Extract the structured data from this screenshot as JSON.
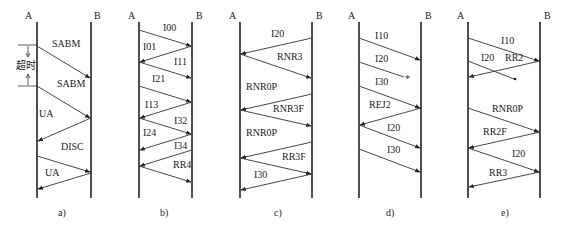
{
  "diagram": {
    "type": "sequence",
    "panels": [
      {
        "id": "a",
        "caption": "a)",
        "station_a": "A",
        "station_b": "B",
        "timeout_label": "超时",
        "messages": [
          {
            "label": "SABM",
            "dir": "A->B"
          },
          {
            "label": "SABM",
            "dir": "A->B"
          },
          {
            "label": "UA",
            "dir": "B->A"
          },
          {
            "label": "DISC",
            "dir": "A->B"
          },
          {
            "label": "UA",
            "dir": "B->A"
          }
        ]
      },
      {
        "id": "b",
        "caption": "b)",
        "station_a": "A",
        "station_b": "B",
        "messages": [
          {
            "label": "I00",
            "dir": "A->B"
          },
          {
            "label": "I01",
            "dir": "B->A"
          },
          {
            "label": "I11",
            "dir": "A->B"
          },
          {
            "label": "I21",
            "dir": "A->B"
          },
          {
            "label": "I13",
            "dir": "B->A"
          },
          {
            "label": "I32",
            "dir": "A->B"
          },
          {
            "label": "I24",
            "dir": "B->A"
          },
          {
            "label": "I34",
            "dir": "B->A"
          },
          {
            "label": "RR4",
            "dir": "A->B"
          }
        ]
      },
      {
        "id": "c",
        "caption": "c)",
        "station_a": "A",
        "station_b": "B",
        "messages": [
          {
            "label": "I20",
            "dir": "B->A"
          },
          {
            "label": "RNR3",
            "dir": "A->B"
          },
          {
            "label": "RNR0P",
            "dir": "B->A"
          },
          {
            "label": "RNR3F",
            "dir": "A->B"
          },
          {
            "label": "RNR0P",
            "dir": "B->A"
          },
          {
            "label": "RR3F",
            "dir": "A->B"
          },
          {
            "label": "I30",
            "dir": "B->A"
          }
        ]
      },
      {
        "id": "d",
        "caption": "d)",
        "station_a": "A",
        "station_b": "B",
        "messages": [
          {
            "label": "I10",
            "dir": "A->B"
          },
          {
            "label": "I20",
            "dir": "A->B",
            "lost": true,
            "marker": "*"
          },
          {
            "label": "I30",
            "dir": "A->B"
          },
          {
            "label": "REJ2",
            "dir": "B->A"
          },
          {
            "label": "I20",
            "dir": "A->B"
          },
          {
            "label": "I30",
            "dir": "A->B"
          }
        ]
      },
      {
        "id": "e",
        "caption": "e)",
        "station_a": "A",
        "station_b": "B",
        "messages": [
          {
            "label": "I10",
            "dir": "A->B"
          },
          {
            "label": "I20",
            "dir": "A->B",
            "lost": true,
            "marker": "*"
          },
          {
            "label": "RR2",
            "dir": "B->A"
          },
          {
            "label": "RNR0P",
            "dir": "A->B"
          },
          {
            "label": "RR2F",
            "dir": "B->A"
          },
          {
            "label": "I20",
            "dir": "A->B"
          },
          {
            "label": "RR3",
            "dir": "B->A"
          }
        ]
      }
    ]
  }
}
